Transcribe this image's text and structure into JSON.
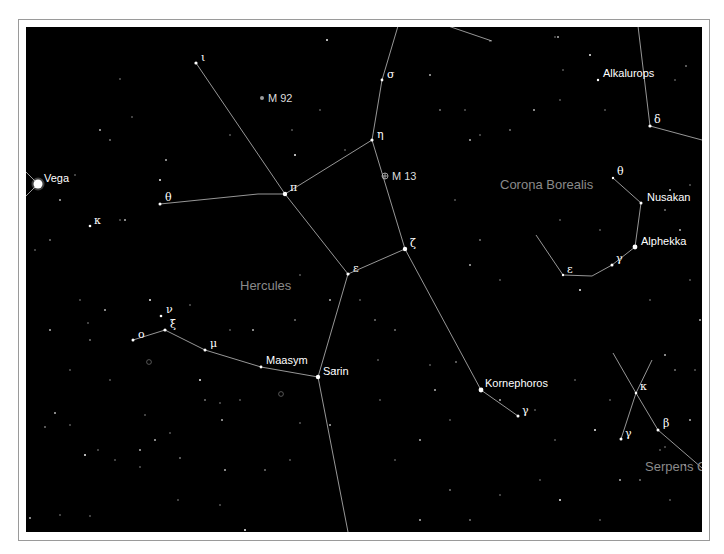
{
  "map": {
    "colors": {
      "sky": "#000000",
      "lines": "#bdbdbd",
      "constellation_label": "#8a8a8a",
      "star_label": "#ffffff"
    },
    "constellations": [
      {
        "name": "Hercules",
        "x": 240,
        "y": 290
      },
      {
        "name": "Corona Borealis",
        "x": 500,
        "y": 189
      },
      {
        "name": "Serpens C",
        "x": 645,
        "y": 471
      }
    ],
    "named_stars": [
      {
        "name": "Vega",
        "x": 38,
        "y": 184,
        "r": 4.5,
        "lx": 44,
        "ly": 182
      },
      {
        "name": "Alkalurops",
        "x": 598,
        "y": 80,
        "r": 1.2,
        "lx": 603,
        "ly": 77
      },
      {
        "name": "Nusakan",
        "x": 641,
        "y": 203,
        "r": 1.5,
        "lx": 647,
        "ly": 201
      },
      {
        "name": "Alphekka",
        "x": 635,
        "y": 247,
        "r": 2.4,
        "lx": 641,
        "ly": 245
      },
      {
        "name": "Maasym",
        "x": 261,
        "y": 367,
        "r": 1.4,
        "lx": 266,
        "ly": 364
      },
      {
        "name": "Sarin",
        "x": 318,
        "y": 377,
        "r": 2.2,
        "lx": 323,
        "ly": 375
      },
      {
        "name": "Kornephoros",
        "x": 481,
        "y": 390,
        "r": 2.4,
        "lx": 485,
        "ly": 387
      }
    ],
    "greek_stars": [
      {
        "label": "ι",
        "x": 196,
        "y": 63,
        "r": 1.6,
        "lx": 201,
        "ly": 61
      },
      {
        "label": "σ",
        "x": 382,
        "y": 80,
        "r": 1.4,
        "lx": 387,
        "ly": 78
      },
      {
        "label": "η",
        "x": 372,
        "y": 140,
        "r": 1.6,
        "lx": 377,
        "ly": 138
      },
      {
        "label": "π",
        "x": 285,
        "y": 194,
        "r": 2.2,
        "lx": 290,
        "ly": 191
      },
      {
        "label": "θ",
        "x": 160,
        "y": 204,
        "r": 1.5,
        "lx": 165,
        "ly": 201
      },
      {
        "label": "κ",
        "x": 90,
        "y": 226,
        "r": 1.3,
        "lx": 94,
        "ly": 224
      },
      {
        "label": "ζ",
        "x": 405,
        "y": 249,
        "r": 2.2,
        "lx": 410,
        "ly": 247
      },
      {
        "label": "ε",
        "x": 348,
        "y": 274,
        "r": 1.6,
        "lx": 353,
        "ly": 272
      },
      {
        "label": "ν",
        "x": 161,
        "y": 316,
        "r": 1.3,
        "lx": 166,
        "ly": 313
      },
      {
        "label": "ξ",
        "x": 165,
        "y": 330,
        "r": 1.6,
        "lx": 170,
        "ly": 328
      },
      {
        "label": "ο",
        "x": 133,
        "y": 340,
        "r": 1.5,
        "lx": 138,
        "ly": 338
      },
      {
        "label": "μ",
        "x": 205,
        "y": 350,
        "r": 1.5,
        "lx": 210,
        "ly": 347
      },
      {
        "label": "γ",
        "x": 518,
        "y": 416,
        "r": 1.5,
        "lx": 522,
        "ly": 414
      },
      {
        "label": "δ",
        "x": 650,
        "y": 126,
        "r": 1.6,
        "lx": 654,
        "ly": 123
      },
      {
        "label": "θ",
        "x": 613,
        "y": 178,
        "r": 1.2,
        "lx": 617,
        "ly": 175
      },
      {
        "label": "γ",
        "x": 612,
        "y": 265,
        "r": 1.5,
        "lx": 616,
        "ly": 262
      },
      {
        "label": "ε",
        "x": 563,
        "y": 275,
        "r": 1.2,
        "lx": 567,
        "ly": 273
      },
      {
        "label": "κ",
        "x": 636,
        "y": 393,
        "r": 1.3,
        "lx": 640,
        "ly": 390
      },
      {
        "label": "β",
        "x": 658,
        "y": 430,
        "r": 1.5,
        "lx": 663,
        "ly": 427
      },
      {
        "label": "γ",
        "x": 621,
        "y": 439,
        "r": 1.5,
        "lx": 625,
        "ly": 437
      }
    ],
    "deep_sky": [
      {
        "name": "M 92",
        "x": 262,
        "y": 98,
        "symbol": "dot",
        "lx": 268,
        "ly": 102
      },
      {
        "name": "M 13",
        "x": 385,
        "y": 176,
        "symbol": "globular",
        "lx": 392,
        "ly": 180
      },
      {
        "name": "",
        "x": 149,
        "y": 362,
        "symbol": "ring"
      },
      {
        "name": "",
        "x": 281,
        "y": 394,
        "symbol": "ring"
      }
    ],
    "lines": [
      [
        [
          196,
          63
        ],
        [
          285,
          194
        ]
      ],
      [
        [
          285,
          194
        ],
        [
          348,
          274
        ]
      ],
      [
        [
          160,
          204
        ],
        [
          258,
          194
        ],
        [
          285,
          194
        ]
      ],
      [
        [
          285,
          194
        ],
        [
          372,
          140
        ]
      ],
      [
        [
          372,
          140
        ],
        [
          382,
          80
        ],
        [
          398,
          26
        ]
      ],
      [
        [
          372,
          140
        ],
        [
          405,
          249
        ]
      ],
      [
        [
          348,
          274
        ],
        [
          405,
          249
        ]
      ],
      [
        [
          405,
          249
        ],
        [
          481,
          390
        ]
      ],
      [
        [
          481,
          390
        ],
        [
          518,
          416
        ]
      ],
      [
        [
          348,
          274
        ],
        [
          318,
          377
        ]
      ],
      [
        [
          318,
          377
        ],
        [
          348,
          532
        ]
      ],
      [
        [
          133,
          340
        ],
        [
          165,
          330
        ],
        [
          205,
          350
        ],
        [
          261,
          367
        ],
        [
          318,
          377
        ]
      ],
      [
        [
          448,
          26
        ],
        [
          492,
          41
        ]
      ],
      [
        [
          638,
          26
        ],
        [
          650,
          126
        ]
      ],
      [
        [
          650,
          126
        ],
        [
          702,
          140
        ]
      ],
      [
        [
          613,
          178
        ],
        [
          641,
          203
        ],
        [
          635,
          247
        ],
        [
          612,
          265
        ],
        [
          592,
          276
        ],
        [
          563,
          275
        ],
        [
          536,
          235
        ]
      ],
      [
        [
          613,
          353
        ],
        [
          636,
          393
        ],
        [
          658,
          430
        ],
        [
          702,
          468
        ]
      ],
      [
        [
          652,
          360
        ],
        [
          636,
          393
        ],
        [
          621,
          439
        ]
      ],
      [
        [
          26,
          172
        ],
        [
          38,
          184
        ]
      ],
      [
        [
          26,
          196
        ],
        [
          38,
          184
        ]
      ]
    ],
    "field_stars": [
      [
        327,
        40
      ],
      [
        490,
        41
      ],
      [
        555,
        37
      ],
      [
        558,
        37
      ],
      [
        686,
        66
      ],
      [
        120,
        79
      ],
      [
        166,
        160
      ],
      [
        132,
        117
      ],
      [
        110,
        140
      ],
      [
        100,
        130
      ],
      [
        230,
        135
      ],
      [
        292,
        130
      ],
      [
        295,
        155
      ],
      [
        320,
        110
      ],
      [
        345,
        150
      ],
      [
        430,
        75
      ],
      [
        440,
        110
      ],
      [
        465,
        110
      ],
      [
        470,
        140
      ],
      [
        480,
        135
      ],
      [
        510,
        130
      ],
      [
        534,
        110
      ],
      [
        560,
        100
      ],
      [
        563,
        70
      ],
      [
        590,
        55
      ],
      [
        605,
        110
      ],
      [
        675,
        80
      ],
      [
        670,
        190
      ],
      [
        665,
        210
      ],
      [
        690,
        185
      ],
      [
        680,
        230
      ],
      [
        455,
        200
      ],
      [
        480,
        240
      ],
      [
        470,
        265
      ],
      [
        500,
        280
      ],
      [
        530,
        190
      ],
      [
        160,
        180
      ],
      [
        75,
        175
      ],
      [
        120,
        220
      ],
      [
        125,
        220
      ],
      [
        50,
        240
      ],
      [
        80,
        300
      ],
      [
        105,
        310
      ],
      [
        88,
        323
      ],
      [
        90,
        340
      ],
      [
        50,
        330
      ],
      [
        70,
        370
      ],
      [
        110,
        380
      ],
      [
        150,
        300
      ],
      [
        190,
        305
      ],
      [
        230,
        330
      ],
      [
        253,
        330
      ],
      [
        295,
        320
      ],
      [
        300,
        275
      ],
      [
        330,
        300
      ],
      [
        360,
        300
      ],
      [
        375,
        320
      ],
      [
        335,
        370
      ],
      [
        378,
        360
      ],
      [
        380,
        400
      ],
      [
        200,
        380
      ],
      [
        220,
        403
      ],
      [
        240,
        400
      ],
      [
        222,
        420
      ],
      [
        205,
        400
      ],
      [
        145,
        415
      ],
      [
        155,
        440
      ],
      [
        170,
        433
      ],
      [
        180,
        458
      ],
      [
        140,
        450
      ],
      [
        140,
        467
      ],
      [
        115,
        460
      ],
      [
        85,
        455
      ],
      [
        98,
        450
      ],
      [
        70,
        425
      ],
      [
        55,
        413
      ],
      [
        45,
        427
      ],
      [
        300,
        423
      ],
      [
        330,
        425
      ],
      [
        290,
        460
      ],
      [
        265,
        470
      ],
      [
        225,
        470
      ],
      [
        220,
        505
      ],
      [
        178,
        500
      ],
      [
        245,
        530
      ],
      [
        60,
        515
      ],
      [
        90,
        516
      ],
      [
        30,
        518
      ],
      [
        395,
        330
      ],
      [
        430,
        365
      ],
      [
        435,
        390
      ],
      [
        450,
        420
      ],
      [
        456,
        362
      ],
      [
        500,
        400
      ],
      [
        535,
        410
      ],
      [
        555,
        440
      ],
      [
        595,
        430
      ],
      [
        610,
        400
      ],
      [
        575,
        380
      ],
      [
        620,
        480
      ],
      [
        640,
        480
      ],
      [
        665,
        447
      ],
      [
        685,
        465
      ],
      [
        660,
        450
      ],
      [
        450,
        490
      ],
      [
        420,
        440
      ],
      [
        395,
        460
      ],
      [
        500,
        495
      ],
      [
        560,
        500
      ],
      [
        600,
        520
      ],
      [
        670,
        500
      ],
      [
        420,
        520
      ],
      [
        470,
        520
      ],
      [
        540,
        480
      ],
      [
        690,
        420
      ],
      [
        695,
        370
      ],
      [
        675,
        370
      ],
      [
        665,
        355
      ],
      [
        560,
        220
      ],
      [
        600,
        230
      ],
      [
        580,
        290
      ],
      [
        650,
        300
      ],
      [
        690,
        280
      ],
      [
        700,
        320
      ],
      [
        25,
        300
      ],
      [
        35,
        250
      ],
      [
        60,
        200
      ]
    ]
  }
}
